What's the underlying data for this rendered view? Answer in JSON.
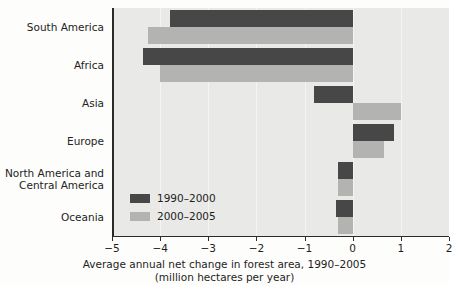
{
  "chart_data": {
    "type": "bar",
    "orientation": "horizontal",
    "title": "",
    "xlabel": "Average annual net change in forest area, 1990–2005",
    "xlabel_line2": "(million hectares per year)",
    "ylabel": "",
    "xlim": [
      -5,
      2
    ],
    "xticks": [
      -5,
      -4,
      -3,
      -2,
      -1,
      0,
      1,
      2
    ],
    "xticklabels": [
      "−5",
      "−4",
      "−3",
      "−2",
      "−1",
      "0",
      "1",
      "2"
    ],
    "grid": true,
    "legend_position": "inside-lower-left",
    "categories": [
      "South America",
      "Africa",
      "Asia",
      "Europe",
      "North America and\nCentral America",
      "Oceania"
    ],
    "series": [
      {
        "name": "1990–2000",
        "color": "#474747",
        "values": [
          -3.8,
          -4.35,
          -0.8,
          0.85,
          -0.3,
          -0.35
        ]
      },
      {
        "name": "2000–2005",
        "color": "#b3b3b1",
        "values": [
          -4.25,
          -4.0,
          1.0,
          0.65,
          -0.3,
          -0.3
        ]
      }
    ],
    "colors": {
      "series_1990_2000": "#474747",
      "series_2000_2005": "#b3b3b1",
      "plot_background": "#e9e9e7",
      "axis": "#2a2a2a"
    }
  }
}
